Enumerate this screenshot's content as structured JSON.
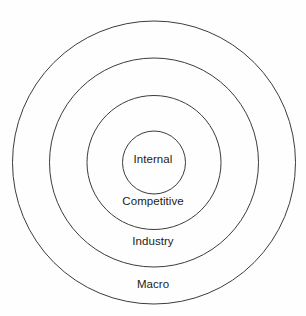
{
  "diagram": {
    "type": "concentric-circles",
    "background_color": "#fefefe",
    "stroke_color": "#3c3c3c",
    "text_color": "#1c1c1c",
    "center": {
      "x": 154,
      "y": 162.5
    },
    "rings": [
      {
        "id": "macro",
        "label": "Macro",
        "radius": 141.5,
        "level": 4,
        "label_position": {
          "x": 154,
          "y": 284
        }
      },
      {
        "id": "industry",
        "label": "Industry",
        "radius": 104.5,
        "level": 3,
        "label_position": {
          "x": 154,
          "y": 241
        }
      },
      {
        "id": "competitive",
        "label": "Competitive",
        "radius": 67,
        "level": 2,
        "label_position": {
          "x": 154,
          "y": 201
        }
      },
      {
        "id": "internal",
        "label": "Internal",
        "radius": 31.5,
        "level": 1,
        "label_position": {
          "x": 154,
          "y": 159
        }
      }
    ]
  }
}
